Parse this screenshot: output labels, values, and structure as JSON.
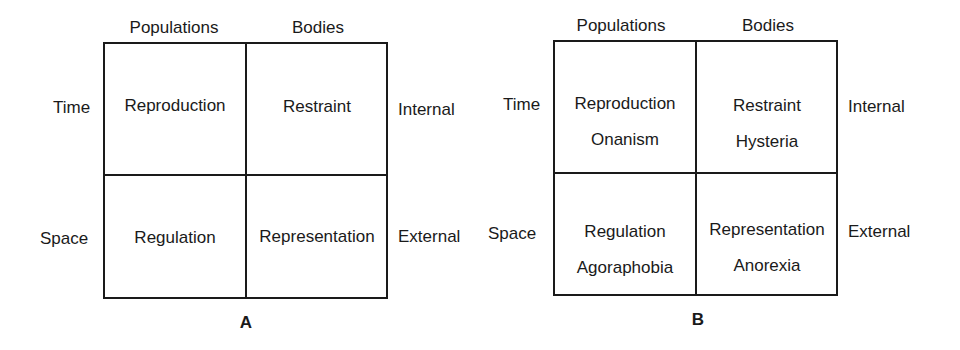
{
  "panels": [
    {
      "id": "A",
      "caption": "A",
      "column_headers": [
        "Populations",
        "Bodies"
      ],
      "row_labels_left": [
        "Time",
        "Space"
      ],
      "row_labels_right": [
        "Internal",
        "External"
      ],
      "cells": [
        [
          "Reproduction",
          "Restraint"
        ],
        [
          "Regulation",
          "Representation"
        ]
      ]
    },
    {
      "id": "B",
      "caption": "B",
      "column_headers": [
        "Populations",
        "Bodies"
      ],
      "row_labels_left": [
        "Time",
        "Space"
      ],
      "row_labels_right": [
        "Internal",
        "External"
      ],
      "cells": [
        [
          "Reproduction",
          "Restraint"
        ],
        [
          "Regulation",
          "Representation"
        ]
      ],
      "cells_secondary": [
        [
          "Onanism",
          "Hysteria"
        ],
        [
          "Agoraphobia",
          "Anorexia"
        ]
      ]
    }
  ]
}
